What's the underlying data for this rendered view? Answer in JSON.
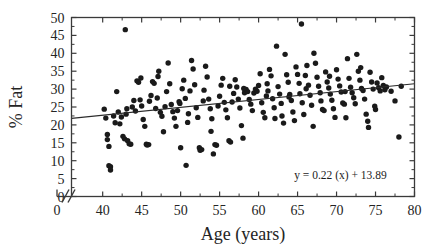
{
  "chart_data": {
    "type": "scatter",
    "title": "",
    "xlabel": "Age (years)",
    "ylabel": "% Fat",
    "xlim": [
      36,
      80
    ],
    "ylim": [
      0,
      50
    ],
    "xticks": [
      40,
      45,
      50,
      55,
      60,
      65,
      70,
      75,
      80
    ],
    "xtick_labels": [
      "40",
      "45",
      "50",
      "55",
      "60",
      "65",
      "70",
      "75",
      "80"
    ],
    "x_origin_label": "0",
    "yticks": [
      0,
      5,
      10,
      15,
      20,
      25,
      30,
      35,
      40,
      45,
      50
    ],
    "ytick_labels": [
      "0",
      "5",
      "10",
      "15",
      "20",
      "25",
      "30",
      "35",
      "40",
      "45",
      "50"
    ],
    "axis_break": {
      "present": true,
      "symbol": "//",
      "axis": "x",
      "note": "x-axis broken between 0 and 40"
    },
    "grid": false,
    "legend": "none",
    "marker": {
      "shape": "circle",
      "color": "#1a1a1a",
      "size_px": 5.4
    },
    "frame": {
      "box": true,
      "ticks_all_sides": true,
      "color": "#3a3a3a"
    },
    "annotations": [
      {
        "name": "regression-equation",
        "text": "y = 0.22 (x) + 13.89",
        "x": 70.5,
        "y": 5.0
      }
    ],
    "fit_line": {
      "type": "linear",
      "slope": 0.22,
      "intercept": 13.89,
      "equation": "y = 0.22 (x) + 13.89",
      "x_start": 36,
      "x_end": 80,
      "y_start": 21.81,
      "y_end": 31.49,
      "color": "#2b2b2b"
    },
    "points": [
      [
        40.2,
        24.4
      ],
      [
        40.4,
        21.9
      ],
      [
        40.6,
        17.3
      ],
      [
        40.6,
        15.9
      ],
      [
        40.8,
        14.0
      ],
      [
        40.8,
        8.6
      ],
      [
        41.0,
        8.3
      ],
      [
        41.0,
        7.4
      ],
      [
        41.4,
        22.5
      ],
      [
        41.6,
        20.6
      ],
      [
        41.8,
        29.3
      ],
      [
        42.0,
        23.6
      ],
      [
        42.2,
        20.3
      ],
      [
        42.4,
        22.2
      ],
      [
        42.6,
        16.8
      ],
      [
        42.8,
        16.1
      ],
      [
        42.9,
        46.6
      ],
      [
        43.0,
        23.0
      ],
      [
        43.1,
        24.5
      ],
      [
        43.2,
        15.6
      ],
      [
        43.4,
        14.7
      ],
      [
        43.6,
        14.6
      ],
      [
        43.8,
        25.0
      ],
      [
        44.0,
        26.8
      ],
      [
        44.2,
        23.9
      ],
      [
        44.4,
        32.3
      ],
      [
        44.6,
        31.9
      ],
      [
        44.8,
        27.0
      ],
      [
        45.0,
        25.3
      ],
      [
        45.2,
        21.5
      ],
      [
        45.4,
        19.6
      ],
      [
        45.6,
        14.6
      ],
      [
        45.7,
        14.4
      ],
      [
        45.9,
        14.5
      ],
      [
        46.0,
        26.6
      ],
      [
        46.2,
        28.2
      ],
      [
        46.4,
        32.1
      ],
      [
        46.6,
        31.6
      ],
      [
        46.8,
        24.6
      ],
      [
        47.0,
        27.5
      ],
      [
        47.2,
        35.0
      ],
      [
        47.4,
        23.5
      ],
      [
        47.6,
        22.4
      ],
      [
        47.8,
        18.1
      ],
      [
        48.0,
        25.1
      ],
      [
        48.2,
        29.3
      ],
      [
        48.4,
        37.3
      ],
      [
        48.6,
        31.5
      ],
      [
        48.8,
        25.7
      ],
      [
        49.0,
        23.7
      ],
      [
        49.2,
        21.9
      ],
      [
        49.4,
        19.6
      ],
      [
        49.6,
        24.0
      ],
      [
        49.8,
        26.5
      ],
      [
        50.0,
        13.6
      ],
      [
        50.2,
        30.1
      ],
      [
        50.4,
        32.5
      ],
      [
        50.6,
        27.4
      ],
      [
        50.7,
        8.7
      ],
      [
        50.9,
        20.7
      ],
      [
        51.0,
        23.1
      ],
      [
        51.2,
        29.5
      ],
      [
        51.4,
        38.0
      ],
      [
        51.6,
        35.6
      ],
      [
        51.8,
        31.2
      ],
      [
        52.0,
        24.8
      ],
      [
        52.2,
        22.1
      ],
      [
        52.4,
        13.6
      ],
      [
        52.5,
        12.9
      ],
      [
        52.7,
        13.1
      ],
      [
        52.9,
        26.7
      ],
      [
        53.0,
        29.7
      ],
      [
        53.2,
        36.4
      ],
      [
        53.4,
        33.4
      ],
      [
        53.6,
        27.2
      ],
      [
        53.8,
        24.5
      ],
      [
        54.0,
        21.7
      ],
      [
        54.2,
        11.9
      ],
      [
        54.4,
        14.5
      ],
      [
        54.6,
        14.3
      ],
      [
        54.8,
        25.3
      ],
      [
        55.0,
        28.0
      ],
      [
        55.2,
        31.1
      ],
      [
        55.4,
        33.0
      ],
      [
        55.6,
        26.3
      ],
      [
        55.8,
        24.2
      ],
      [
        56.0,
        22.0
      ],
      [
        56.2,
        15.6
      ],
      [
        56.4,
        15.2
      ],
      [
        56.6,
        26.4
      ],
      [
        56.8,
        28.8
      ],
      [
        57.0,
        32.6
      ],
      [
        57.2,
        30.6
      ],
      [
        57.4,
        27.2
      ],
      [
        57.6,
        24.7
      ],
      [
        57.8,
        19.8
      ],
      [
        58.0,
        16.3
      ],
      [
        58.2,
        29.0
      ],
      [
        58.4,
        29.9
      ],
      [
        58.6,
        29.3
      ],
      [
        58.8,
        27.1
      ],
      [
        59.0,
        25.8
      ],
      [
        59.2,
        24.0
      ],
      [
        59.4,
        28.9
      ],
      [
        59.6,
        30.0
      ],
      [
        59.8,
        29.4
      ],
      [
        60.0,
        31.0
      ],
      [
        60.2,
        34.3
      ],
      [
        60.4,
        26.2
      ],
      [
        60.6,
        23.5
      ],
      [
        60.8,
        22.0
      ],
      [
        61.0,
        28.1
      ],
      [
        61.2,
        29.5
      ],
      [
        61.4,
        35.5
      ],
      [
        61.6,
        33.7
      ],
      [
        61.8,
        27.3
      ],
      [
        62.0,
        24.8
      ],
      [
        62.1,
        21.8
      ],
      [
        62.3,
        42.0
      ],
      [
        62.5,
        30.7
      ],
      [
        62.7,
        28.6
      ],
      [
        62.9,
        26.0
      ],
      [
        63.0,
        22.5
      ],
      [
        63.2,
        20.5
      ],
      [
        63.4,
        39.7
      ],
      [
        63.6,
        34.0
      ],
      [
        63.8,
        31.9
      ],
      [
        64.0,
        28.5
      ],
      [
        64.2,
        26.8
      ],
      [
        64.4,
        23.6
      ],
      [
        64.6,
        21.2
      ],
      [
        64.8,
        36.2
      ],
      [
        65.0,
        34.1
      ],
      [
        65.2,
        31.6
      ],
      [
        65.3,
        28.7
      ],
      [
        65.5,
        48.2
      ],
      [
        65.6,
        26.2
      ],
      [
        65.8,
        22.9
      ],
      [
        66.0,
        33.8
      ],
      [
        66.2,
        36.6
      ],
      [
        66.4,
        31.1
      ],
      [
        66.6,
        28.3
      ],
      [
        66.8,
        25.5
      ],
      [
        67.0,
        19.6
      ],
      [
        67.1,
        40.0
      ],
      [
        67.3,
        37.2
      ],
      [
        67.5,
        33.3
      ],
      [
        67.7,
        30.8
      ],
      [
        67.9,
        29.0
      ],
      [
        68.0,
        26.7
      ],
      [
        68.2,
        24.3
      ],
      [
        68.4,
        24.0
      ],
      [
        68.6,
        34.8
      ],
      [
        68.8,
        32.0
      ],
      [
        69.0,
        30.3
      ],
      [
        69.2,
        28.6
      ],
      [
        69.4,
        26.9
      ],
      [
        69.6,
        24.5
      ],
      [
        69.8,
        22.1
      ],
      [
        70.0,
        35.4
      ],
      [
        70.2,
        32.8
      ],
      [
        70.4,
        30.9
      ],
      [
        70.6,
        29.2
      ],
      [
        70.8,
        26.1
      ],
      [
        71.0,
        25.8
      ],
      [
        71.2,
        22.0
      ],
      [
        71.4,
        38.5
      ],
      [
        71.6,
        33.0
      ],
      [
        71.8,
        30.5
      ],
      [
        72.0,
        29.0
      ],
      [
        72.2,
        27.6
      ],
      [
        72.4,
        25.9
      ],
      [
        72.6,
        39.7
      ],
      [
        72.8,
        35.0
      ],
      [
        73.0,
        32.5
      ],
      [
        73.2,
        30.2
      ],
      [
        73.4,
        29.6
      ],
      [
        73.6,
        27.2
      ],
      [
        73.8,
        23.0
      ],
      [
        74.0,
        21.0
      ],
      [
        74.1,
        19.3
      ],
      [
        74.3,
        34.7
      ],
      [
        74.5,
        32.0
      ],
      [
        74.7,
        30.0
      ],
      [
        74.9,
        25.2
      ],
      [
        75.0,
        24.3
      ],
      [
        75.2,
        31.7
      ],
      [
        75.4,
        30.4
      ],
      [
        75.6,
        29.5
      ],
      [
        75.8,
        33.2
      ],
      [
        76.0,
        31.0
      ],
      [
        76.2,
        29.8
      ],
      [
        76.4,
        30.6
      ],
      [
        77.0,
        29.4
      ],
      [
        77.5,
        26.7
      ],
      [
        78.0,
        16.6
      ],
      [
        78.3,
        30.8
      ],
      [
        44.9,
        33.1
      ],
      [
        47.1,
        33.5
      ],
      [
        49.9,
        26.0
      ],
      [
        53.9,
        18.2
      ],
      [
        56.3,
        30.8
      ],
      [
        58.1,
        30.2
      ],
      [
        61.1,
        31.5
      ],
      [
        63.9,
        27.8
      ],
      [
        66.1,
        30.1
      ],
      [
        69.1,
        33.6
      ],
      [
        71.1,
        29.3
      ],
      [
        73.1,
        36.0
      ]
    ]
  }
}
